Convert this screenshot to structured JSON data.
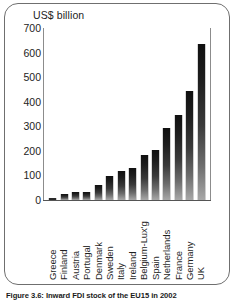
{
  "figure": {
    "caption": "Figure 3.6: Inward FDI stock of the EU15 in 2002",
    "panel_border_color": "#6f6f6f",
    "bar_color_top": "#101010",
    "bar_color_bottom": "#a8a8a8"
  },
  "chart_data": {
    "type": "bar",
    "title": "",
    "subtitle": "",
    "xlabel": "",
    "ylabel": "US$ billion",
    "ylim": [
      0,
      700
    ],
    "yticks": [
      700,
      600,
      500,
      400,
      300,
      200,
      100,
      0
    ],
    "ytick_labels": [
      "700",
      "600",
      "500",
      "400",
      "300",
      "200",
      "100",
      "0"
    ],
    "grid": false,
    "legend": null,
    "legend_position": "none",
    "categories": [
      "Greece",
      "Finland",
      "Austria",
      "Portugal",
      "Denmark",
      "Sweden",
      "Italy",
      "Ireland",
      "Belgium-Lux'g",
      "Spain",
      "Netherlands",
      "France",
      "Germany",
      "UK"
    ],
    "values": [
      8,
      25,
      32,
      33,
      62,
      98,
      118,
      130,
      185,
      205,
      295,
      345,
      445,
      635
    ],
    "value_unit": "US$ billion"
  }
}
